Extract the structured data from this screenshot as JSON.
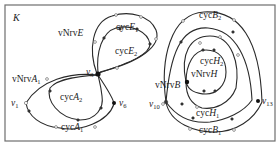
{
  "figure": {
    "graph_name": "K",
    "border_color": "#6e6e6e",
    "edge_color": "#2a2a2a"
  },
  "labels": {
    "vNrvE": {
      "prefix": "vNrv",
      "var": "E",
      "sub": ""
    },
    "cycE1": {
      "prefix": "cyc",
      "var": "E",
      "sub": "1"
    },
    "cycE2": {
      "prefix": "cyc",
      "var": "E",
      "sub": "2"
    },
    "v3": {
      "prefix": "",
      "var": "v",
      "sub": "3"
    },
    "vNrvA1": {
      "prefix": "vNrv",
      "var": "A",
      "sub": "1"
    },
    "cycA2": {
      "prefix": "cyc",
      "var": "A",
      "sub": "2"
    },
    "v1": {
      "prefix": "",
      "var": "v",
      "sub": "1"
    },
    "v6": {
      "prefix": "",
      "var": "v",
      "sub": "6"
    },
    "cycA1": {
      "prefix": "cyc",
      "var": "A",
      "sub": "1"
    },
    "cycB2": {
      "prefix": "cyc",
      "var": "B",
      "sub": "2"
    },
    "cycH2": {
      "prefix": "cyc",
      "var": "H",
      "sub": "2"
    },
    "vNrvH": {
      "prefix": "vNrv",
      "var": "H",
      "sub": ""
    },
    "vNrvB": {
      "prefix": "vNrv",
      "var": "B",
      "sub": ""
    },
    "v10": {
      "prefix": "",
      "var": "v",
      "sub": "10"
    },
    "v13": {
      "prefix": "",
      "var": "v",
      "sub": "13"
    },
    "cycH1": {
      "prefix": "cyc",
      "var": "H",
      "sub": "1"
    },
    "cycB1": {
      "prefix": "cyc",
      "var": "B",
      "sub": "1"
    }
  },
  "components": [
    {
      "name": "left-component",
      "vertices": [
        "v1",
        "v3",
        "v6"
      ],
      "cycles": [
        "cycA1",
        "cycA2",
        "cycE1",
        "cycE2"
      ],
      "nerve_vertices": [
        "vNrvA1",
        "vNrvE"
      ]
    },
    {
      "name": "right-component",
      "vertices": [
        "v10",
        "v13"
      ],
      "cycles": [
        "cycB1",
        "cycB2",
        "cycH1",
        "cycH2"
      ],
      "nerve_vertices": [
        "vNrvB",
        "vNrvH"
      ]
    }
  ]
}
